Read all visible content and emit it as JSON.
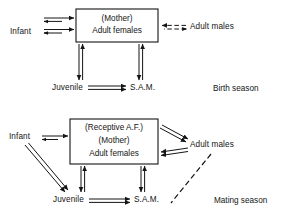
{
  "figure": {
    "background_color": "#ffffff",
    "line_color": "#141414"
  },
  "panels": [
    {
      "id": "birth-season",
      "season_label": "Birth season",
      "box": {
        "lines": [
          "(Mother)",
          "Adult females"
        ]
      },
      "nodes": [
        {
          "id": "infant",
          "label": "Infant"
        },
        {
          "id": "adult-males",
          "label": "Adult males"
        },
        {
          "id": "juvenile",
          "label": "Juvenile"
        },
        {
          "id": "sam",
          "label": "S.A.M."
        }
      ],
      "edges": [
        {
          "from": "infant",
          "to": "adult-females",
          "style": "double-solid",
          "direction": "right"
        },
        {
          "from": "infant",
          "to": "adult-females",
          "style": "double-solid",
          "direction": "right"
        },
        {
          "from": "adult-males",
          "to": "adult-females",
          "style": "double-dashed",
          "direction": "left"
        },
        {
          "from": "adult-females",
          "to": "juvenile",
          "style": "double-solid",
          "direction": "both"
        },
        {
          "from": "adult-females",
          "to": "sam",
          "style": "double-solid",
          "direction": "both"
        },
        {
          "from": "juvenile",
          "to": "sam",
          "style": "double-solid",
          "direction": "right"
        }
      ]
    },
    {
      "id": "mating-season",
      "season_label": "Mating season",
      "box": {
        "lines": [
          "(Receptive A.F.)",
          "(Mother)",
          "Adult females"
        ]
      },
      "nodes": [
        {
          "id": "infant",
          "label": "Infant"
        },
        {
          "id": "adult-males",
          "label": "Adult males"
        },
        {
          "id": "juvenile",
          "label": "Juvenile"
        },
        {
          "id": "sam",
          "label": "S.A.M."
        }
      ],
      "edges": [
        {
          "from": "infant",
          "to": "adult-females",
          "style": "double-solid",
          "direction": "right"
        },
        {
          "from": "adult-females",
          "to": "adult-males",
          "style": "double-solid",
          "direction": "right"
        },
        {
          "from": "adult-males",
          "to": "adult-females",
          "style": "double-solid",
          "direction": "left"
        },
        {
          "from": "infant",
          "to": "juvenile",
          "style": "double-solid",
          "direction": "down"
        },
        {
          "from": "adult-females",
          "to": "juvenile",
          "style": "double-solid",
          "direction": "both"
        },
        {
          "from": "adult-females",
          "to": "sam",
          "style": "double-solid",
          "direction": "both"
        },
        {
          "from": "juvenile",
          "to": "sam",
          "style": "double-solid",
          "direction": "right"
        },
        {
          "from": "adult-males",
          "to": "sam",
          "style": "single-dashed",
          "direction": "none"
        }
      ]
    }
  ]
}
